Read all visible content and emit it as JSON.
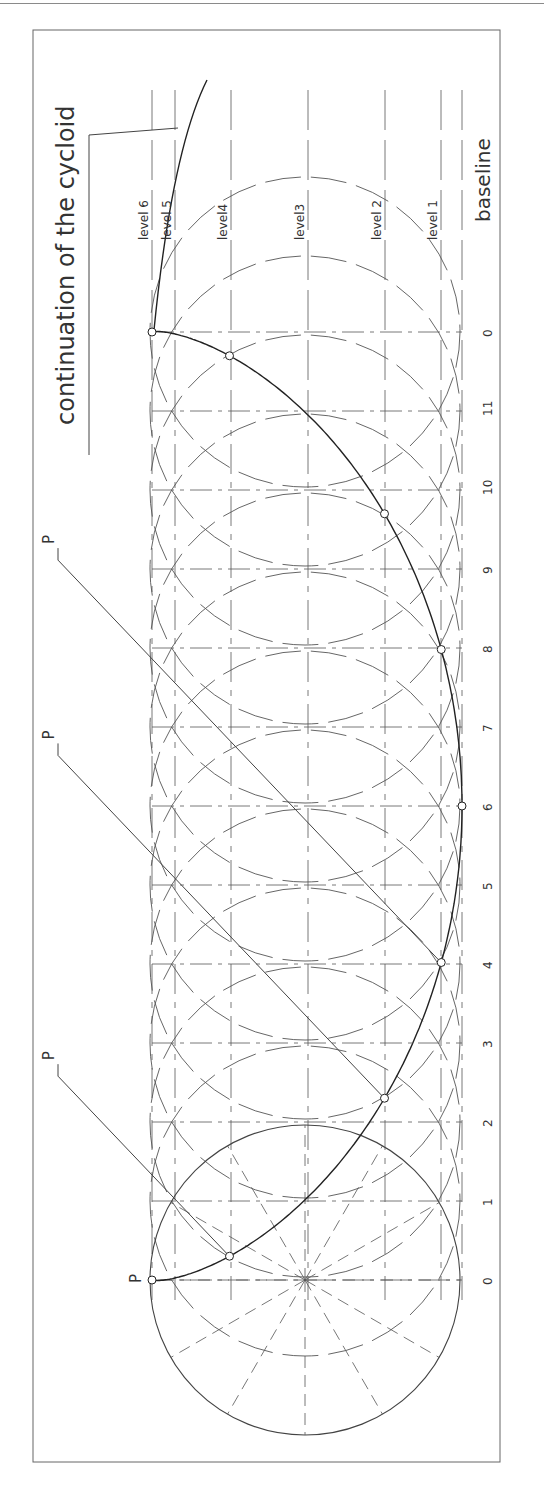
{
  "title": "continuation of the cycloid",
  "labels": {
    "baseline": "baseline",
    "levels": [
      "level 1",
      "level 2",
      "level3",
      "level4",
      "level 5",
      "level 6"
    ],
    "point": "P",
    "divisions": [
      "0",
      "1",
      "2",
      "3",
      "4",
      "5",
      "6",
      "7",
      "8",
      "9",
      "10",
      "11",
      "0"
    ]
  },
  "geometry": {
    "frame": {
      "x": 33,
      "y": 30,
      "w": 467,
      "h": 1432
    },
    "circle_center": {
      "x": 305,
      "y": 1280
    },
    "radius": 155,
    "division_spacing": 79,
    "baseline_x": 462,
    "level_x": [
      441,
      385,
      308,
      231,
      175,
      152
    ]
  },
  "colors": {
    "line": "#444444",
    "curve": "#222222",
    "dash": "#555555",
    "text": "#333333",
    "frame": "#666666"
  },
  "cycloid_points_marked": [
    0,
    2,
    4,
    5,
    6,
    7,
    8,
    10,
    12
  ],
  "p_callouts": [
    2,
    4,
    5
  ]
}
